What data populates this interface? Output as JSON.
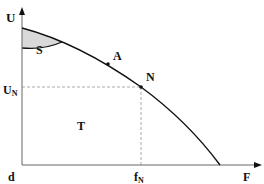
{
  "diagram": {
    "type": "characteristic-curve",
    "axes": {
      "y_label": "U",
      "x_label": "F",
      "origin_label": "d"
    },
    "points": [
      {
        "label": "A"
      },
      {
        "label": "N"
      }
    ],
    "regions": [
      {
        "label": "S",
        "fill": "#d9d9d9"
      },
      {
        "label": "T"
      }
    ],
    "guides": {
      "y_value_label": "U",
      "y_value_sub": "N",
      "x_value_label": "f",
      "x_value_sub": "N"
    },
    "colors": {
      "curve": "#111111",
      "axis": "#555555",
      "guide": "#aaaaaa",
      "shaded": "#d9d9d9"
    }
  }
}
